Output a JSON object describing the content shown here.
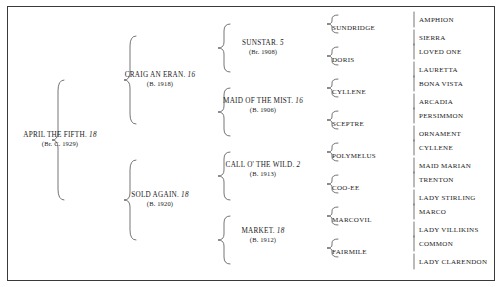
{
  "chart": {
    "type": "pedigree-tree",
    "generations": 5,
    "border_color": "#3a3a3a",
    "text_color": "#1a1a1a"
  },
  "gen1": [
    {
      "name": "APRIL THE FIFTH.",
      "number": "18",
      "year": "(Br. C. 1929)"
    }
  ],
  "gen2": [
    {
      "name": "CRAIG AN ERAN.",
      "number": "16",
      "year": "(B. 1918)"
    },
    {
      "name": "SOLD AGAIN.",
      "number": "18",
      "year": "(B. 1920)"
    }
  ],
  "gen3": [
    {
      "name": "SUNSTAR.",
      "number": "5",
      "year": "(Br. 1908)"
    },
    {
      "name": "MAID OF THE MIST.",
      "number": "16",
      "year": "(B. 1906)"
    },
    {
      "name": "CALL O' THE WILD.",
      "number": "2",
      "year": "(B. 1913)"
    },
    {
      "name": "MARKET.",
      "number": "18",
      "year": "(B. 1912)"
    }
  ],
  "gen4": [
    {
      "name": "SUNDRIDGE"
    },
    {
      "name": "DORIS"
    },
    {
      "name": "CYLLENE"
    },
    {
      "name": "SCEPTRE"
    },
    {
      "name": "POLYMELUS"
    },
    {
      "name": "COO-EE"
    },
    {
      "name": "MARCOVIL"
    },
    {
      "name": "FAIRMILE"
    }
  ],
  "gen5": [
    {
      "name": "AMPHION"
    },
    {
      "name": "SIERRA"
    },
    {
      "name": "LOVED ONE"
    },
    {
      "name": "LAURETTA"
    },
    {
      "name": "BONA VISTA"
    },
    {
      "name": "ARCADIA"
    },
    {
      "name": "PERSIMMON"
    },
    {
      "name": "ORNAMENT"
    },
    {
      "name": "CYLLENE"
    },
    {
      "name": "MAID MARIAN"
    },
    {
      "name": "TRENTON"
    },
    {
      "name": "LADY STIRLING"
    },
    {
      "name": "MARCO"
    },
    {
      "name": "LADY VILLIKINS"
    },
    {
      "name": "COMMON"
    },
    {
      "name": "LADY CLARENDON"
    }
  ]
}
